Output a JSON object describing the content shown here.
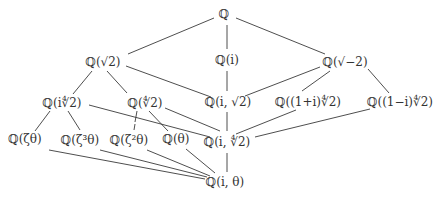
{
  "diagram": {
    "nodes": [
      {
        "id": "Q",
        "label": "ℚ",
        "x": 224,
        "y": 14
      },
      {
        "id": "Qs2",
        "label": "ℚ(√2)",
        "x": 103,
        "y": 62
      },
      {
        "id": "Qi",
        "label": "ℚ(i)",
        "x": 227,
        "y": 60
      },
      {
        "id": "Qsm2",
        "label": "ℚ(√−2)",
        "x": 345,
        "y": 62
      },
      {
        "id": "Qi42",
        "label": "ℚ(i∜2)",
        "x": 62,
        "y": 103
      },
      {
        "id": "Q42",
        "label": "ℚ(∜2)",
        "x": 145,
        "y": 103
      },
      {
        "id": "Qis2",
        "label": "ℚ(i, √2)",
        "x": 228,
        "y": 102
      },
      {
        "id": "Q1pi",
        "label": "ℚ((1+i)∜2)",
        "x": 308,
        "y": 102
      },
      {
        "id": "Q1mi",
        "label": "ℚ((1−i)∜2)",
        "x": 400,
        "y": 102
      },
      {
        "id": "Qzt",
        "label": "ℚ(ζθ)",
        "x": 25,
        "y": 139
      },
      {
        "id": "Qz3t",
        "label": "ℚ(ζ³θ)",
        "x": 80,
        "y": 140
      },
      {
        "id": "Qz2t",
        "label": "ℚ(ζ²θ)",
        "x": 129,
        "y": 140
      },
      {
        "id": "Qt",
        "label": "ℚ(θ)",
        "x": 176,
        "y": 139
      },
      {
        "id": "Qi42b",
        "label": "ℚ(i, ∜2)",
        "x": 227,
        "y": 142
      },
      {
        "id": "Qit",
        "label": "ℚ(i, θ)",
        "x": 225,
        "y": 182
      }
    ],
    "edges": [
      [
        214,
        18,
        128,
        54
      ],
      [
        227,
        25,
        227,
        49
      ],
      [
        236,
        18,
        325,
        54
      ],
      [
        92,
        71,
        73,
        94
      ],
      [
        107,
        71,
        127,
        93
      ],
      [
        126,
        66,
        211,
        97
      ],
      [
        227,
        71,
        227,
        91
      ],
      [
        320,
        67,
        245,
        96
      ],
      [
        330,
        71,
        302,
        91
      ],
      [
        368,
        69,
        389,
        93
      ],
      [
        50,
        111,
        35,
        131
      ],
      [
        68,
        111,
        80,
        130
      ],
      [
        137,
        111,
        135,
        122
      ],
      [
        135,
        124,
        134,
        130
      ],
      [
        149,
        111,
        168,
        131
      ],
      [
        89,
        105,
        210,
        137
      ],
      [
        165,
        108,
        220,
        131
      ],
      [
        227,
        112,
        227,
        131
      ],
      [
        296,
        110,
        236,
        134
      ],
      [
        370,
        109,
        255,
        137
      ],
      [
        49,
        150,
        205,
        179
      ],
      [
        100,
        150,
        207,
        177
      ],
      [
        147,
        150,
        210,
        176
      ],
      [
        186,
        149,
        215,
        173
      ],
      [
        227,
        153,
        227,
        172
      ]
    ]
  }
}
